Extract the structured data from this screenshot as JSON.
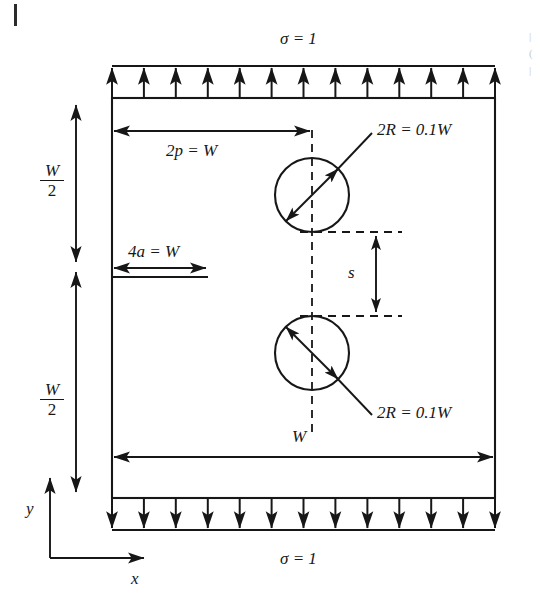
{
  "figure": {
    "canvas": {
      "width": 543,
      "height": 611
    },
    "background_color": "#ffffff",
    "line_color": "#171717"
  },
  "labels": {
    "stress_top": "σ = 1",
    "stress_bottom": "σ = 1",
    "pitch": "2p = W",
    "crack": "4a = W",
    "hole_top": "2R = 0.1W",
    "hole_bottom": "2R = 0.1W",
    "spacing": "s",
    "width": "W",
    "half_height_top_num": "W",
    "half_height_top_den": "2",
    "half_height_bottom_num": "W",
    "half_height_bottom_den": "2",
    "axis_y": "y",
    "axis_x": "x"
  },
  "geometry": {
    "plate": {
      "left": 112,
      "right": 495,
      "top": 98,
      "bottom": 498
    },
    "top_band": {
      "y_top": 66,
      "y_bottom": 98,
      "arrow_count": 13,
      "direction": "up"
    },
    "bottom_band": {
      "y_top": 498,
      "y_bottom": 530,
      "arrow_count": 13,
      "direction": "down"
    },
    "holes": [
      {
        "cx": 312,
        "cy": 195,
        "r": 37,
        "label": "2R = 0.1W"
      },
      {
        "cx": 312,
        "cy": 353,
        "r": 37,
        "label": "2R = 0.1W"
      }
    ],
    "centerline": {
      "x": 312,
      "y_top": 130,
      "y_bottom": 437,
      "style": "dashed"
    },
    "crack": {
      "x_start": 112,
      "x_end": 208,
      "y": 277
    },
    "spacing_dim": {
      "x": 376,
      "y_top": 232,
      "y_bottom": 316,
      "value_label": "s"
    },
    "pitch_dim": {
      "x_start": 112,
      "x_end": 312,
      "y": 131
    },
    "crack_dim": {
      "x_start": 112,
      "x_end": 208,
      "y": 268
    },
    "width_dim": {
      "x_start": 112,
      "x_end": 495,
      "y": 457
    },
    "half_height_dims": [
      {
        "x": 76,
        "y_start": 105,
        "y_end": 262,
        "direction": "both",
        "label": "W/2"
      },
      {
        "x": 76,
        "y_start": 272,
        "y_end": 492,
        "direction": "both",
        "label": "W/2"
      }
    ],
    "axes": {
      "origin_x": 50,
      "origin_y": 558,
      "y_tip": 474,
      "x_tip": 148
    }
  },
  "annotations": {
    "top_stress_units": 13,
    "bottom_stress_units": 13,
    "dashed_extent_right": 402
  }
}
